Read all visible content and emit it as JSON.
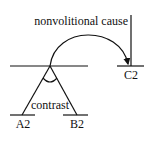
{
  "diagram": {
    "type": "relation-tree",
    "stroke_color": "#111111",
    "background": "#ffffff",
    "relations": {
      "top": "nonvolitional cause",
      "inner": "contrast"
    },
    "nodes": {
      "a": "A2",
      "b": "B2",
      "c": "C2"
    }
  }
}
